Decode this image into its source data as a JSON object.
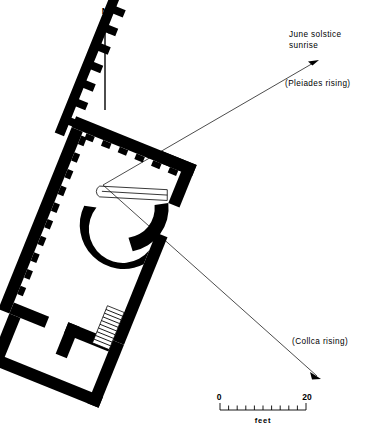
{
  "figure": {
    "type": "archaeological-site-plan"
  },
  "compass": {
    "label": "N",
    "icon": "north-arrow-icon"
  },
  "sightlines": [
    {
      "id": "june-solstice",
      "title_line1": "June solstice",
      "title_line2": "sunrise",
      "subtitle": "(Pleiades rising)",
      "origin": {
        "x": 103,
        "y": 185
      },
      "target": {
        "x": 319,
        "y": 60
      }
    },
    {
      "id": "collca",
      "subtitle": "(Collca rising)",
      "origin": {
        "x": 103,
        "y": 185
      },
      "target": {
        "x": 321,
        "y": 379
      }
    }
  ],
  "scalebar": {
    "min_label": "0",
    "max_label": "20",
    "unit_label": "feet",
    "divisions": 10
  },
  "colors": {
    "ink": "#000000",
    "paper": "#ffffff"
  }
}
